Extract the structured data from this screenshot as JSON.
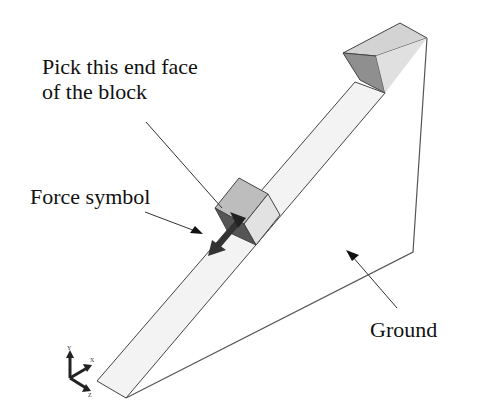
{
  "annotations": {
    "pick_face_line1": "Pick this end face",
    "pick_face_line2": "of the block",
    "force_symbol": "Force symbol",
    "ground": "Ground"
  },
  "triad": {
    "x_label": "X",
    "y_label": "Y",
    "z_label": "Z"
  },
  "colors": {
    "beam_fill": "#f3f3f3",
    "block_top": "#cfcfcf",
    "block_side": "#8f8f8f",
    "force_arrow": "#333333",
    "outline": "#444444"
  }
}
